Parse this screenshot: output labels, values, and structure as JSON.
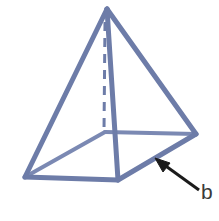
{
  "figure": {
    "name": "square-pyramid-diagram",
    "background_color": "#ffffff",
    "edge_color": "#6d7ca8",
    "edge_color_dark": "#5e6e9c",
    "base_fill_color": "#e7ebf4",
    "face_fill_color": "#ffffff",
    "annotation_color": "#1b1b1b",
    "label_color": "#3a3a3a",
    "edge_width": 5,
    "hidden_edge_width": 3,
    "vertices": {
      "apex": [
        107,
        9
      ],
      "base_front_left": [
        25,
        177
      ],
      "base_front": [
        118,
        180
      ],
      "base_right": [
        196,
        134
      ],
      "base_back_hidden": [
        105,
        132
      ]
    },
    "visible_edges": [
      {
        "name": "apex-to-front-left",
        "from": "apex",
        "to": "base_front_left"
      },
      {
        "name": "apex-to-front",
        "from": "apex",
        "to": "base_front"
      },
      {
        "name": "apex-to-right",
        "from": "apex",
        "to": "base_right"
      },
      {
        "name": "base-front-left-to-front",
        "from": "base_front_left",
        "to": "base_front"
      },
      {
        "name": "base-front-to-right",
        "from": "base_front",
        "to": "base_right"
      },
      {
        "name": "base-front-left-to-back",
        "from": "base_front_left",
        "to": "base_back_hidden"
      },
      {
        "name": "base-back-to-right",
        "from": "base_back_hidden",
        "to": "base_right"
      }
    ],
    "hidden_edges": [
      {
        "name": "apex-to-back-altitude",
        "from": "apex",
        "to": "base_back_hidden",
        "style": "dashed"
      }
    ],
    "annotation": {
      "name": "leader-arrow-to-base-edge",
      "label": "b",
      "arrow_tip": [
        157,
        160
      ],
      "arrow_tail": [
        199,
        190
      ],
      "label_position": [
        201,
        181
      ],
      "points_to": "base-front-to-right"
    }
  }
}
